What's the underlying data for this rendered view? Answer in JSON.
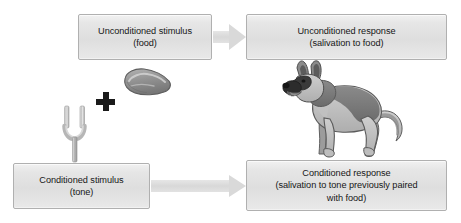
{
  "diagram": {
    "width": 461,
    "height": 223,
    "background_color": "#ffffff"
  },
  "colors": {
    "box_fill": "#e2e2e2",
    "box_border": "#b0b0b0",
    "box_text": "#161616",
    "arrow_fill": "#d8d8d8",
    "plus_sign": "#1a1a1a",
    "dog_body_light": "#b9b9b9",
    "dog_body_dark": "#6f6f6f",
    "dog_muzzle": "#2e2e2e",
    "drool": "#ffffff",
    "meat_fill": "#9a9a9a",
    "fork_metal": "#c9c9c9"
  },
  "boxes": {
    "unconditioned_stimulus": {
      "name": "Unconditioned stimulus",
      "line1": "Unconditioned stimulus",
      "line2": "(food)"
    },
    "unconditioned_response": {
      "name": "Unconditioned response",
      "line1": "Unconditioned response",
      "line2": "(salivation to food)"
    },
    "conditioned_stimulus": {
      "name": "Conditioned stimulus",
      "line1": "Conditioned stimulus",
      "line2": "(tone)"
    },
    "conditioned_response": {
      "name": "Conditioned response",
      "line1": "Conditioned response",
      "line2": "(salivation to tone previously paired",
      "line3": "with food)"
    }
  },
  "icons": {
    "plus": "plus-sign",
    "top_arrow": "right-arrow-icon",
    "bottom_arrow": "right-arrow-icon",
    "meat": "meat-steak-illustration",
    "tuning_fork": "tuning-fork-illustration",
    "dog": "salivating-dog-illustration"
  }
}
